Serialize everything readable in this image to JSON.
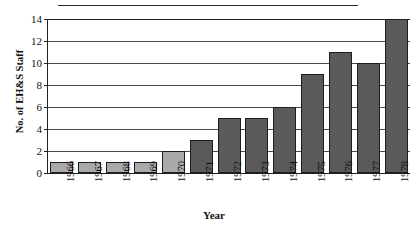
{
  "chart_data": {
    "type": "bar",
    "title": "",
    "xlabel": "Year",
    "ylabel": "No. of EH&S Staff",
    "categories": [
      "1966",
      "1967",
      "1968",
      "1969",
      "1970",
      "1971",
      "1972",
      "1973",
      "1974",
      "1975",
      "1976",
      "1977",
      "1978"
    ],
    "values": [
      1,
      1,
      1,
      1,
      2,
      3,
      5,
      5,
      6,
      9,
      11,
      10,
      14
    ],
    "ylim": [
      0,
      14
    ],
    "ytick_labels": [
      "0",
      "2",
      "4",
      "6",
      "8",
      "10",
      "12",
      "14"
    ],
    "ytick_values": [
      0,
      2,
      4,
      6,
      8,
      10,
      12,
      14
    ],
    "grid": true,
    "legend": "none",
    "bar_colors": [
      "#a9a9a9",
      "#a9a9a9",
      "#a9a9a9",
      "#a9a9a9",
      "#a9a9a9",
      "#5a5a5a",
      "#5a5a5a",
      "#5a5a5a",
      "#5a5a5a",
      "#5a5a5a",
      "#5a5a5a",
      "#5a5a5a",
      "#5a5a5a"
    ],
    "colors": {
      "light_bar": "#a9a9a9",
      "dark_bar": "#5a5a5a",
      "bar_outline": "#1d1d1d",
      "axis": "#222222",
      "gridline": "#4a4a4a",
      "background": "#ffffff",
      "text": "#111111"
    }
  }
}
